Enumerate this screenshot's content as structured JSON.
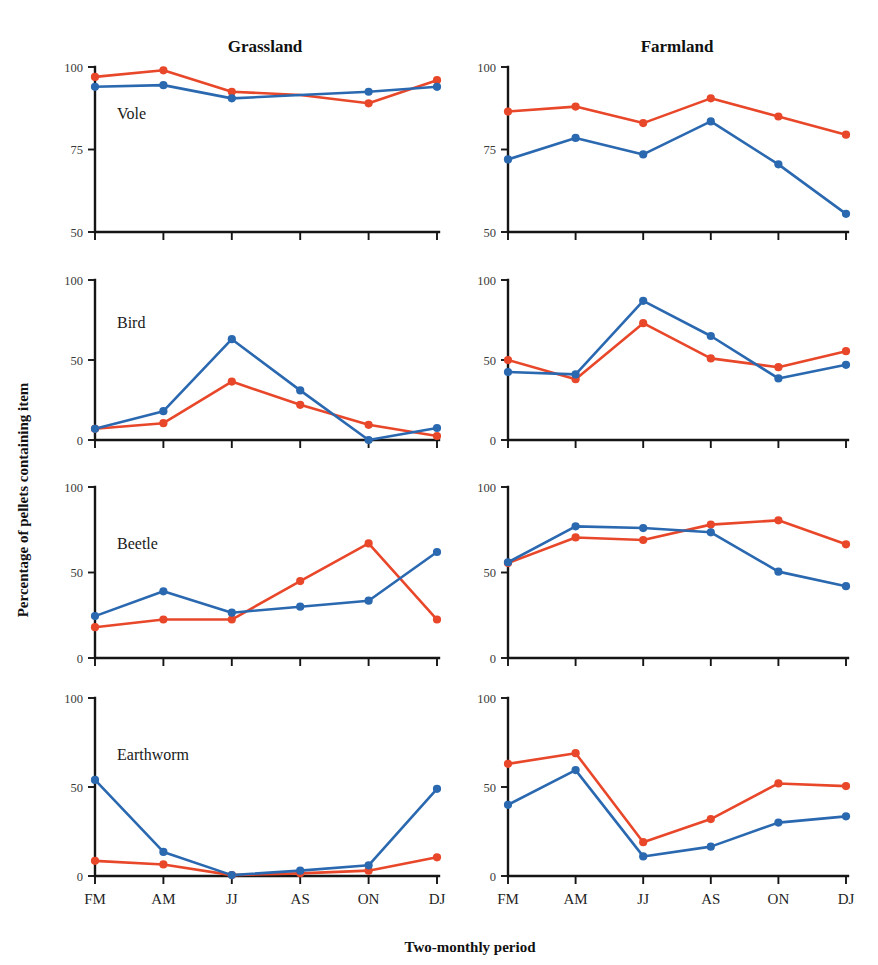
{
  "figure": {
    "column_titles": [
      "Grassland",
      "Farmland"
    ],
    "y_axis_title": "Percentage of pellets containing item",
    "x_axis_title": "Two-monthly period",
    "row_labels": [
      "Vole",
      "Bird",
      "Beetle",
      "Earthworm"
    ],
    "x_tick_labels": [
      "FM",
      "AM",
      "JJ",
      "AS",
      "ON",
      "DJ"
    ],
    "top_cropped_text": "",
    "colors": {
      "series_red": "#e8472a",
      "series_blue": "#2a68b0",
      "axis": "#151515",
      "background": "#ffffff",
      "tick_text": "#3a3a3a"
    }
  },
  "chart_data": [
    {
      "type": "line",
      "title": "Grassland",
      "panel": "Vole",
      "xlabel": "Two-monthly period",
      "ylabel": "Percentage of pellets containing item",
      "x": [
        "FM",
        "AM",
        "JJ",
        "AS",
        "ON",
        "DJ"
      ],
      "ylim": [
        50,
        100
      ],
      "yticks": [
        50,
        75,
        100
      ],
      "grid": false,
      "legend": "none",
      "series": [
        {
          "name": "series-red",
          "color": "#e8472a",
          "values": [
            97,
            99,
            92.5,
            91.5,
            89,
            96
          ]
        },
        {
          "name": "series-blue",
          "color": "#2a68b0",
          "values": [
            94,
            94.5,
            90.5,
            91.5,
            92.5,
            94
          ]
        }
      ]
    },
    {
      "type": "line",
      "title": "Farmland",
      "panel": "Vole",
      "xlabel": "Two-monthly period",
      "ylabel": "Percentage of pellets containing item",
      "x": [
        "FM",
        "AM",
        "JJ",
        "AS",
        "ON",
        "DJ"
      ],
      "ylim": [
        50,
        100
      ],
      "yticks": [
        50,
        75,
        100
      ],
      "grid": false,
      "legend": "none",
      "series": [
        {
          "name": "series-red",
          "color": "#e8472a",
          "values": [
            86.5,
            88,
            83,
            90.5,
            85,
            79.5
          ]
        },
        {
          "name": "series-blue",
          "color": "#2a68b0",
          "values": [
            72,
            78.5,
            73.5,
            83.5,
            70.5,
            55.5
          ]
        }
      ]
    },
    {
      "type": "line",
      "title": "Grassland",
      "panel": "Bird",
      "xlabel": "Two-monthly period",
      "ylabel": "Percentage of pellets containing item",
      "x": [
        "FM",
        "AM",
        "JJ",
        "AS",
        "ON",
        "DJ"
      ],
      "ylim": [
        0,
        100
      ],
      "yticks": [
        0,
        50,
        100
      ],
      "grid": false,
      "legend": "none",
      "series": [
        {
          "name": "series-red",
          "color": "#e8472a",
          "values": [
            7,
            10.5,
            36.5,
            22,
            9.5,
            2.5
          ]
        },
        {
          "name": "series-blue",
          "color": "#2a68b0",
          "values": [
            7,
            18,
            63,
            31,
            0,
            7.5
          ]
        }
      ]
    },
    {
      "type": "line",
      "title": "Farmland",
      "panel": "Bird",
      "xlabel": "Two-monthly period",
      "ylabel": "Percentage of pellets containing item",
      "x": [
        "FM",
        "AM",
        "JJ",
        "AS",
        "ON",
        "DJ"
      ],
      "ylim": [
        0,
        100
      ],
      "yticks": [
        0,
        50,
        100
      ],
      "grid": false,
      "legend": "none",
      "series": [
        {
          "name": "series-red",
          "color": "#e8472a",
          "values": [
            50,
            38,
            73,
            51,
            45.5,
            55.5
          ]
        },
        {
          "name": "series-blue",
          "color": "#2a68b0",
          "values": [
            42.5,
            41,
            87,
            65,
            38.5,
            47
          ]
        }
      ]
    },
    {
      "type": "line",
      "title": "Grassland",
      "panel": "Beetle",
      "xlabel": "Two-monthly period",
      "ylabel": "Percentage of pellets containing item",
      "x": [
        "FM",
        "AM",
        "JJ",
        "AS",
        "ON",
        "DJ"
      ],
      "ylim": [
        0,
        100
      ],
      "yticks": [
        0,
        50,
        100
      ],
      "grid": false,
      "legend": "none",
      "series": [
        {
          "name": "series-red",
          "color": "#e8472a",
          "values": [
            18,
            22.5,
            22.5,
            45,
            67,
            22.5
          ]
        },
        {
          "name": "series-blue",
          "color": "#2a68b0",
          "values": [
            24.5,
            39,
            26.5,
            30,
            33.5,
            62
          ]
        }
      ]
    },
    {
      "type": "line",
      "title": "Farmland",
      "panel": "Beetle",
      "xlabel": "Two-monthly period",
      "ylabel": "Percentage of pellets containing item",
      "x": [
        "FM",
        "AM",
        "JJ",
        "AS",
        "ON",
        "DJ"
      ],
      "ylim": [
        0,
        100
      ],
      "yticks": [
        0,
        50,
        100
      ],
      "grid": false,
      "legend": "none",
      "series": [
        {
          "name": "series-red",
          "color": "#e8472a",
          "values": [
            55.5,
            70.5,
            69,
            78,
            80.5,
            66.5
          ]
        },
        {
          "name": "series-blue",
          "color": "#2a68b0",
          "values": [
            56,
            77,
            76,
            73.5,
            50.5,
            42
          ]
        }
      ]
    },
    {
      "type": "line",
      "title": "Grassland",
      "panel": "Earthworm",
      "xlabel": "Two-monthly period",
      "ylabel": "Percentage of pellets containing item",
      "x": [
        "FM",
        "AM",
        "JJ",
        "AS",
        "ON",
        "DJ"
      ],
      "ylim": [
        0,
        100
      ],
      "yticks": [
        0,
        50,
        100
      ],
      "grid": false,
      "legend": "none",
      "series": [
        {
          "name": "series-red",
          "color": "#e8472a",
          "values": [
            8.5,
            6.5,
            0.5,
            1.5,
            3,
            10.5
          ]
        },
        {
          "name": "series-blue",
          "color": "#2a68b0",
          "values": [
            54,
            13.5,
            0.5,
            3,
            6,
            49
          ]
        }
      ]
    },
    {
      "type": "line",
      "title": "Farmland",
      "panel": "Earthworm",
      "xlabel": "Two-monthly period",
      "ylabel": "Percentage of pellets containing item",
      "x": [
        "FM",
        "AM",
        "JJ",
        "AS",
        "ON",
        "DJ"
      ],
      "ylim": [
        0,
        100
      ],
      "yticks": [
        0,
        50,
        100
      ],
      "grid": false,
      "legend": "none",
      "series": [
        {
          "name": "series-red",
          "color": "#e8472a",
          "values": [
            63,
            69,
            19,
            32,
            52,
            50.5
          ]
        },
        {
          "name": "series-blue",
          "color": "#2a68b0",
          "values": [
            40,
            59.5,
            11,
            16.5,
            30,
            33.5
          ]
        }
      ]
    }
  ]
}
